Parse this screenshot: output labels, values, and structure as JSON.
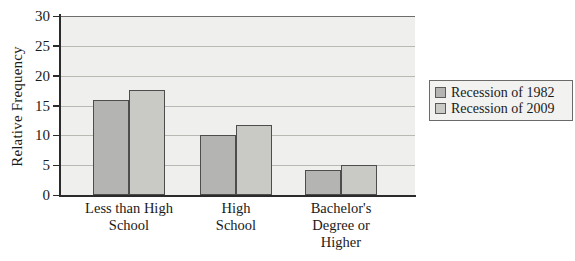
{
  "chart_data": {
    "type": "bar",
    "title": "",
    "xlabel": "",
    "ylabel": "Relative Frequency",
    "ylim": [
      0,
      30
    ],
    "yticks": [
      0,
      5,
      10,
      15,
      20,
      25,
      30
    ],
    "ytick_labels": [
      "0",
      "5",
      "10",
      "15",
      "20",
      "25",
      "30"
    ],
    "grid": true,
    "legend_position": "right",
    "categories": [
      "Less than High\nSchool",
      "High\nSchool",
      "Bachelor's\nDegree or\nHigher"
    ],
    "series": [
      {
        "name": "Recession of 1982",
        "color": "#b4b4b2",
        "values": [
          16.0,
          10.0,
          4.2
        ]
      },
      {
        "name": "Recession of 2009",
        "color": "#c9c9c6",
        "values": [
          17.6,
          11.7,
          5.0
        ]
      }
    ]
  },
  "legend": {
    "items": [
      {
        "label": "Recession of 1982"
      },
      {
        "label": "Recession of 2009"
      }
    ]
  }
}
